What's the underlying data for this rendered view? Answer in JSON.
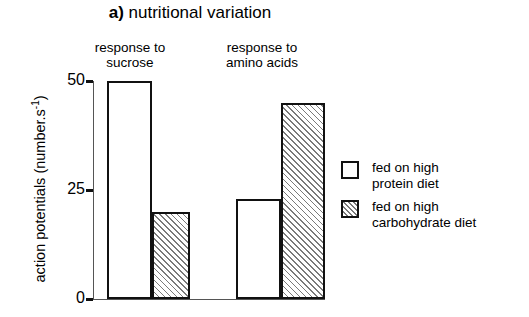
{
  "figure": {
    "panel_label": "a)",
    "title": "nutritional variation"
  },
  "chart_data": {
    "type": "bar",
    "xlabel": "",
    "ylabel": "action potentials (number.s -1)",
    "ylim": [
      0,
      50
    ],
    "yticks": [
      0,
      25,
      50
    ],
    "ytick_labels": [
      "0",
      "25",
      "50"
    ],
    "grid": false,
    "legend_position": "right",
    "groups": [
      {
        "label": "response to\nsucrose",
        "label_line1": "response to",
        "label_line2": "sucrose"
      },
      {
        "label": "response to\namino acids",
        "label_line1": "response to",
        "label_line2": "amino acids"
      }
    ],
    "categories": [
      "response to sucrose",
      "response to amino acids"
    ],
    "series": [
      {
        "name": "fed on high protein diet",
        "fill": "open",
        "values": [
          50,
          23
        ]
      },
      {
        "name": "fed on high carbohydrate diet",
        "fill": "hatched",
        "values": [
          20,
          45
        ]
      }
    ],
    "bars": [
      {
        "group": 0,
        "series": 0,
        "value": 50,
        "fill": "open",
        "left_px": 14,
        "width_px": 45
      },
      {
        "group": 0,
        "series": 1,
        "value": 20,
        "fill": "hatched",
        "left_px": 59,
        "width_px": 38
      },
      {
        "group": 1,
        "series": 0,
        "value": 23,
        "fill": "open",
        "left_px": 143,
        "width_px": 45
      },
      {
        "group": 1,
        "series": 1,
        "value": 45,
        "fill": "hatched",
        "left_px": 188,
        "width_px": 44
      }
    ]
  },
  "yaxis": {
    "label_main": "action potentials (number.s",
    "label_exponent": "-1",
    "label_close": ")",
    "ticks": [
      {
        "label": "50",
        "value": 50
      },
      {
        "label": "25",
        "value": 25
      },
      {
        "label": "0",
        "value": 0
      }
    ]
  },
  "legend": {
    "items": [
      {
        "label": "fed on high\nprotein diet",
        "line1": "fed on high",
        "line2": "protein diet",
        "fill": "open"
      },
      {
        "label": "fed on high\ncarbohydrate diet",
        "line1": "fed on high",
        "line2": "carbohydrate diet",
        "fill": "hatched"
      }
    ]
  },
  "colors": {
    "ink": "#111111",
    "axis": "#555555",
    "hatch": "#7a7a7a",
    "background": "#ffffff"
  }
}
